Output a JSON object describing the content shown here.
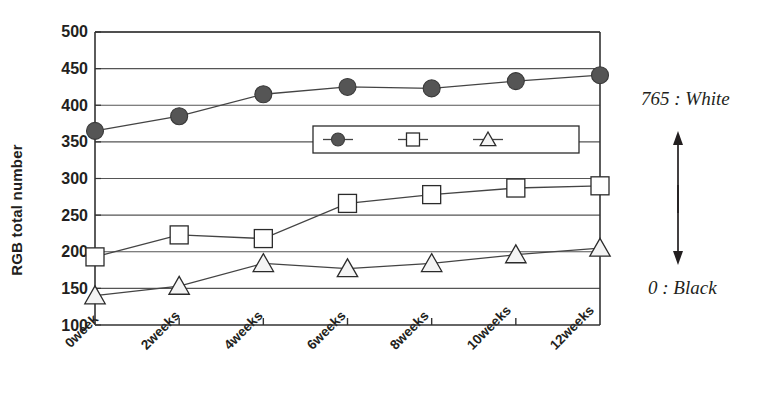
{
  "chart_data": {
    "type": "line",
    "title": "",
    "xlabel": "",
    "ylabel": "RGB total number",
    "categories": [
      "0week",
      "2weeks",
      "4weeks",
      "6weeks",
      "8weeks",
      "10weeks",
      "12weeks"
    ],
    "ylim": [
      100,
      500
    ],
    "ytick_values": [
      100,
      150,
      200,
      250,
      300,
      350,
      400,
      450,
      500
    ],
    "ytick_labels": [
      "100",
      "150",
      "200",
      "250",
      "300",
      "350",
      "400",
      "450",
      "500"
    ],
    "grid": true,
    "legend_position": "center",
    "series": [
      {
        "name": "α CD",
        "marker": "filled-circle",
        "color": "#555555",
        "values": [
          365,
          385,
          415,
          425,
          423,
          433,
          441
        ]
      },
      {
        "name": "β CD",
        "marker": "open-square",
        "color": "#ffffff",
        "values": [
          193,
          223,
          218,
          266,
          278,
          287,
          290
        ]
      },
      {
        "name": "γ CD",
        "marker": "open-triangle",
        "color": "#f2f2f2",
        "values": [
          140,
          153,
          184,
          177,
          184,
          196,
          205
        ]
      }
    ],
    "annotations": [
      {
        "name": "white-note",
        "text": "765 : White"
      },
      {
        "name": "black-note",
        "text": "0 : Black"
      }
    ]
  },
  "legend": {
    "entries": [
      {
        "greek": "α",
        "label": "CD",
        "marker": "filled-circle"
      },
      {
        "greek": "β",
        "label": "CD",
        "marker": "open-square"
      },
      {
        "greek": "γ",
        "label": "CD",
        "marker": "open-triangle"
      }
    ]
  },
  "colors": {
    "axis": "#333333",
    "grid": "#555555",
    "line": "#444444",
    "marker_fill_alpha": "#555555",
    "marker_fill_beta": "#ffffff",
    "marker_fill_gamma": "#f4f4f4",
    "text": "#231f20"
  }
}
